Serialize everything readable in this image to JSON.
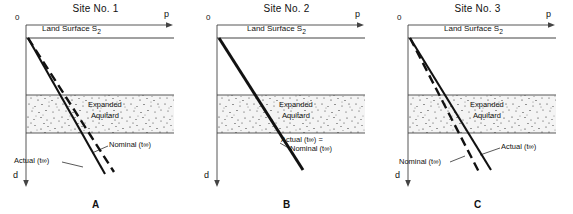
{
  "figure": {
    "axis_p_label": "p",
    "axis_d_label": "d",
    "origin_label": "0",
    "surface_label": "Land Surface S",
    "surface_sub": "2",
    "aquitard_line1": "Expanded",
    "aquitard_line2": "Aquitard",
    "actual_text": "Actual (t",
    "nominal_text": "Nominal (t",
    "inf_sub": "∞",
    "close_paren": ")",
    "equals": "="
  },
  "panels": [
    {
      "title": "Site No. 1",
      "letter": "A",
      "label_actual": "Actual (t∞)",
      "label_nominal": "Nominal (t∞)",
      "label_mode": "separate"
    },
    {
      "title": "Site No. 2",
      "letter": "B",
      "label_actual": "Actual (t∞)  =",
      "label_nominal": "Nominal (t∞)",
      "label_mode": "combined"
    },
    {
      "title": "Site No. 3",
      "letter": "C",
      "label_actual": "Actual (t∞)",
      "label_nominal": "Nominal (t∞)",
      "label_mode": "separate"
    }
  ],
  "colors": {
    "ink": "#111111",
    "background": "#ffffff",
    "aquitard_fill": "#f2f2f2",
    "axis": "#555555"
  }
}
